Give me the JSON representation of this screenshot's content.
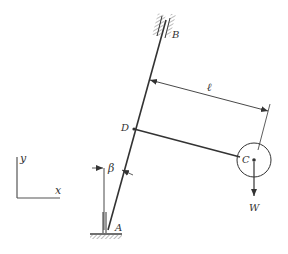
{
  "diagram": {
    "labels": {
      "A": "A",
      "B": "B",
      "C": "C",
      "D": "D",
      "W": "W",
      "ell": "ℓ",
      "beta": "β",
      "x": "x",
      "y": "y"
    },
    "colors": {
      "ink": "#333333",
      "hatch": "#888888",
      "background": "#ffffff"
    }
  }
}
